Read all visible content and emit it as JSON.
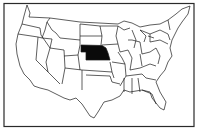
{
  "map": {
    "subject": "Contiguous United States",
    "highlighted_state": "Nebraska",
    "colors": {
      "background": "#ffffff",
      "outline": "#1a1a1a",
      "highlight": "#0a0a0a"
    }
  }
}
